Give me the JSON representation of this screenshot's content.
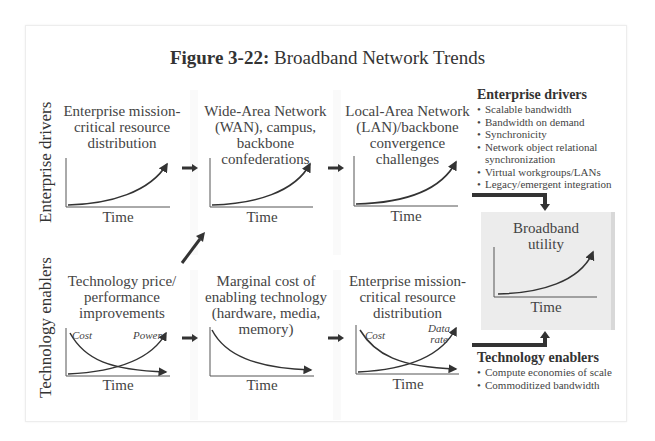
{
  "title": {
    "bold": "Figure 3-22:",
    "rest": "Broadband Network Trends"
  },
  "row_labels": {
    "top": "Enterprise drivers",
    "bottom": "Technology enablers"
  },
  "top_row": [
    {
      "caption": [
        "Enterprise mission-",
        "critical resource",
        "distribution"
      ],
      "xlabel": "Time",
      "curve": "exponential-growth"
    },
    {
      "caption": [
        "Wide-Area Network",
        "(WAN), campus,",
        "backbone",
        "confederations"
      ],
      "xlabel": "Time",
      "curve": "exponential-growth"
    },
    {
      "caption": [
        "Local-Area Network",
        "(LAN)/backbone",
        "convergence",
        "challenges"
      ],
      "xlabel": "Time",
      "curve": "exponential-growth"
    }
  ],
  "bottom_row": [
    {
      "caption": [
        "Technology price/",
        "performance",
        "improvements"
      ],
      "xlabel": "Time",
      "curve": "crossing",
      "labels": {
        "falling": "Cost",
        "rising": "Power"
      }
    },
    {
      "caption": [
        "Marginal cost of",
        "enabling technology",
        "(hardware, media,",
        "memory)"
      ],
      "xlabel": "Time",
      "curve": "decay"
    },
    {
      "caption": [
        "Enterprise mission-",
        "critical resource",
        "distribution"
      ],
      "xlabel": "Time",
      "curve": "crossing",
      "labels": {
        "falling": "Cost",
        "rising": "Data rate"
      }
    }
  ],
  "result": {
    "caption": [
      "Broadband",
      "utility"
    ],
    "xlabel": "Time",
    "curve": "exponential-growth"
  },
  "enterprise_drivers": {
    "heading": "Enterprise drivers",
    "items": [
      "Scalable bandwidth",
      "Bandwidth on demand",
      "Synchronicity",
      "Network object relational synchronization",
      "Virtual workgroups/LANs",
      "Legacy/emergent integration"
    ]
  },
  "technology_enablers": {
    "heading": "Technology enablers",
    "items": [
      "Compute economies of scale",
      "Commoditized bandwidth"
    ]
  },
  "colors": {
    "ink": "#333333",
    "box_fill": "#ececec",
    "box_shadow": "#d8d8d8",
    "frame": "#ededed"
  }
}
